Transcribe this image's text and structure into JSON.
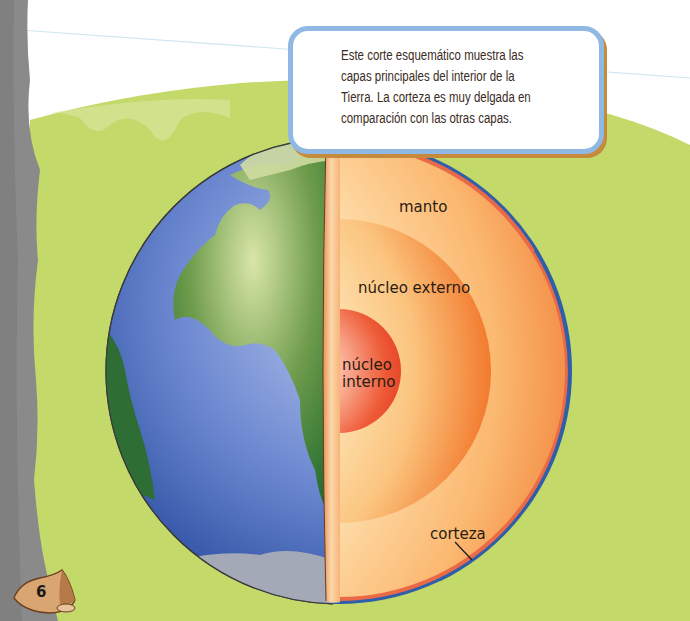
{
  "caption": {
    "line1": "Este corte esquemático muestra las",
    "line2": "capas principales del interior de la",
    "line3": "Tierra. La corteza es muy delgada en",
    "line4": "comparación con las otras capas."
  },
  "labels": {
    "manto": "manto",
    "nucleo_externo": "núcleo externo",
    "nucleo_interno_1": "núcleo",
    "nucleo_interno_2": "interno",
    "corteza": "corteza"
  },
  "page": {
    "number": "6"
  },
  "colors": {
    "background_green": "#c3d96a",
    "sky": "#ffffff",
    "rock_gray": "#8a8a8a",
    "ocean": "#4f6fc0",
    "land": "#4f8a3a",
    "mantle": "#f6a65a",
    "outer_core": "#f58a3a",
    "inner_core": "#e8452a",
    "crust": "#e8684a",
    "caption_border": "#8fb9e4"
  }
}
